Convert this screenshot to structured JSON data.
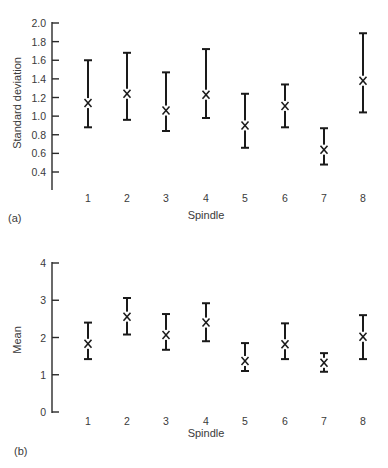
{
  "figure": {
    "panels": [
      {
        "panel_label": "(a)",
        "ylabel": "Standard deviation",
        "xlabel": "Spindle"
      },
      {
        "panel_label": "(b)",
        "ylabel": "Mean",
        "xlabel": "Spindle"
      }
    ]
  },
  "chart_data": [
    {
      "type": "scatter",
      "subtype": "error-bar",
      "title": "",
      "panel_label": "(a)",
      "xlabel": "Spindle",
      "ylabel": "Standard deviation",
      "categories": [
        "1",
        "2",
        "3",
        "4",
        "5",
        "6",
        "7",
        "8"
      ],
      "yticks": [
        "2.0",
        "1.8",
        "1.6",
        "1.4",
        "1.2",
        "1.0",
        "0.8",
        "0.6",
        "0.4"
      ],
      "ylim": [
        0.2,
        2.0
      ],
      "grid": false,
      "legend": null,
      "marker": "x",
      "series": [
        {
          "name": "Standard deviation",
          "center": [
            1.14,
            1.24,
            1.06,
            1.23,
            0.9,
            1.11,
            0.64,
            1.38
          ],
          "upper": [
            1.6,
            1.68,
            1.47,
            1.72,
            1.24,
            1.34,
            0.87,
            1.89
          ],
          "lower": [
            0.88,
            0.96,
            0.84,
            0.98,
            0.66,
            0.88,
            0.48,
            1.04
          ]
        }
      ]
    },
    {
      "type": "scatter",
      "subtype": "error-bar",
      "title": "",
      "panel_label": "(b)",
      "xlabel": "Spindle",
      "ylabel": "Mean",
      "categories": [
        "1",
        "2",
        "3",
        "4",
        "5",
        "6",
        "7",
        "8"
      ],
      "yticks": [
        "4",
        "3",
        "2",
        "1",
        "0"
      ],
      "ylim": [
        0,
        4
      ],
      "grid": false,
      "legend": null,
      "marker": "x",
      "series": [
        {
          "name": "Mean",
          "center": [
            1.83,
            2.56,
            2.07,
            2.4,
            1.37,
            1.82,
            1.32,
            2.02
          ],
          "upper": [
            2.4,
            3.06,
            2.63,
            2.92,
            1.85,
            2.38,
            1.58,
            2.6
          ],
          "lower": [
            1.42,
            2.08,
            1.67,
            1.9,
            1.1,
            1.42,
            1.08,
            1.42
          ]
        }
      ]
    }
  ]
}
